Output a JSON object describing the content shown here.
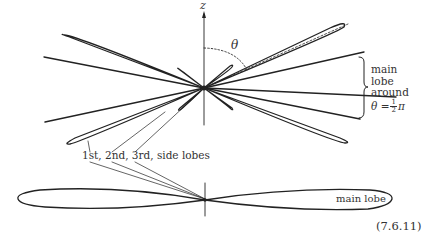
{
  "figure": {
    "axis_label": "z",
    "angle_label": "θ",
    "main_lobe_annotation": {
      "lines": [
        "main",
        "lobe",
        "around"
      ],
      "equation_prefix": "θ =",
      "fraction_numerator": "1",
      "fraction_denominator": "2",
      "equation_suffix": "π"
    },
    "side_lobes_label": "1st, 2nd, 3rd, side lobes",
    "bottom_lobe_label": "main lobe",
    "equation_number": "(7.6.11)",
    "line_color": "#222222"
  }
}
